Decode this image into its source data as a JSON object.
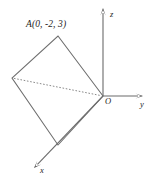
{
  "figure": {
    "background_color": "#ffffff",
    "line_color": "#6e6e6e",
    "label_color": "#1d1d1d",
    "width": 152,
    "height": 184
  },
  "labels": {
    "point_a": "A(0, -2, 3)",
    "axis_z": "z",
    "axis_y": "y",
    "axis_x": "x",
    "origin": "O"
  },
  "chart_data": {
    "type": "diagram",
    "axes": [
      {
        "name": "z",
        "label": "z",
        "from": [
          103,
          96
        ],
        "to": [
          103,
          8
        ],
        "arrow": true,
        "direction": "up"
      },
      {
        "name": "y",
        "label": "y",
        "from": [
          103,
          96
        ],
        "to": [
          143,
          96
        ],
        "arrow": true,
        "direction": "right"
      },
      {
        "name": "x",
        "label": "x",
        "from": [
          103,
          96
        ],
        "to": [
          34,
          168
        ],
        "arrow": true,
        "direction": "down-left"
      }
    ],
    "vertices": [
      {
        "name": "O",
        "label": "O",
        "x": 103,
        "y": 96,
        "coords": [
          0,
          0,
          0
        ]
      },
      {
        "name": "A",
        "label": "A(0, -2, 3)",
        "x": 58,
        "y": 36,
        "coords": [
          0,
          -2,
          3
        ]
      },
      {
        "name": "left",
        "label": "",
        "x": 12,
        "y": 78,
        "coords": null
      },
      {
        "name": "bottom",
        "label": "",
        "x": 58,
        "y": 145,
        "coords": null
      }
    ],
    "polygon": {
      "name": "square",
      "closed": true,
      "points": [
        [
          103,
          96
        ],
        [
          58,
          36
        ],
        [
          12,
          78
        ],
        [
          58,
          145
        ]
      ],
      "style": "solid"
    },
    "dashed_segments": [
      {
        "name": "diagonal-left-to-origin",
        "from": [
          12,
          78
        ],
        "to": [
          103,
          96
        ],
        "style": "dotted"
      }
    ],
    "xlabel": "x",
    "ylabel": "y",
    "zlabel": "z",
    "grid": false,
    "legend": null
  }
}
